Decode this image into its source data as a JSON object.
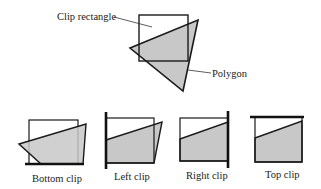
{
  "top_figure": {
    "clip_rectangle_label": "Clip rectangle",
    "polygon_label": "Polygon"
  },
  "stages": [
    {
      "label": "Bottom clip"
    },
    {
      "label": "Left clip"
    },
    {
      "label": "Right clip"
    },
    {
      "label": "Top clip"
    }
  ],
  "colors": {
    "fill": "#c8c8c8",
    "stroke": "#1a1a1a"
  }
}
